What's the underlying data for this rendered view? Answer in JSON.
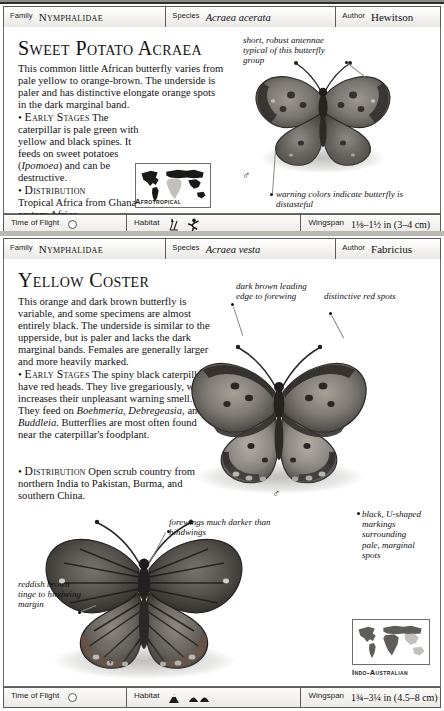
{
  "page": {
    "background": "#ffffff",
    "frame_color": "#b9b7b2"
  },
  "entries": [
    {
      "header": {
        "family_label": "Family",
        "family_value": "Nymphalidae",
        "species_label": "Species",
        "species_value": "Acraea acerata",
        "author_label": "Author",
        "author_value": "Hewitson"
      },
      "title": "Sweet Potato Acraea",
      "description": "This common little African butterfly varies from pale yellow to orange-brown. The underside is paler and has distinctive elongate orange spots in the dark marginal band.",
      "early_stages_label": "Early Stages",
      "early_stages": " The caterpillar is pale green with yellow and black spines. It feeds on sweet potatoes (Ipomoea) and can be destructive.",
      "early_stages_italic": "Ipomoea",
      "distribution_label": "Distribution",
      "distribution": "Tropical Africa from Ghana to eastern Africa.",
      "map_caption": "Afrotropical",
      "map_region": "africa",
      "callouts": [
        {
          "text": "short, robust antennae typical of this butterfly group",
          "name": "callout-antennae"
        },
        {
          "text": "warning colors indicate butterfly is distasteful",
          "name": "callout-warning-colors"
        }
      ],
      "sex_symbol": "♂",
      "footer": {
        "time_of_flight_label": "Time of Flight",
        "time_of_flight_icon": "sun-icon",
        "habitat_label": "Habitat",
        "habitat_icons": [
          "grass-icon",
          "runner-icon"
        ],
        "wingspan_label": "Wingspan",
        "wingspan_value": "1⅛–1½ in (3–4 cm)"
      }
    },
    {
      "header": {
        "family_label": "Family",
        "family_value": "Nymphalidae",
        "species_label": "Species",
        "species_value": "Acraea vesta",
        "author_label": "Author",
        "author_value": "Fabricius"
      },
      "title": "Yellow Coster",
      "description": "This orange and dark brown butterfly is variable, and some specimens are almost entirely black. The underside is similar to the upperside, but is paler and lacks the dark marginal bands. Females are generally larger and more heavily marked.",
      "early_stages_label": "Early Stages",
      "early_stages": " The spiny black caterpillars have red heads. They live gregariously, which increases their unpleasant warning smell. They feed on Boehmeria, Debregeasia, and Buddleia. Butterflies are most often found near the caterpillar's foodplant.",
      "early_stages_plants": [
        "Boehmeria",
        "Debregeasia",
        "Buddleia"
      ],
      "distribution_label": "Distribution",
      "distribution": "Open scrub country from northern India to Pakistan, Burma, and southern China.",
      "map_caption": "Indo-Australian",
      "map_region": "indo-australian",
      "callouts": [
        {
          "text": "dark brown leading edge to forewing",
          "name": "callout-leading-edge"
        },
        {
          "text": "distinctive red spots",
          "name": "callout-red-spots"
        },
        {
          "text": "forewings much darker than hindwings",
          "name": "callout-forewings-darker"
        },
        {
          "text": "black, U-shaped markings surrounding pale, marginal spots",
          "name": "callout-u-shaped-markings"
        },
        {
          "text": "reddish brown tinge to hindwing margin",
          "name": "callout-reddish-tinge"
        }
      ],
      "sex_symbol_upper": "♂",
      "sex_symbol_lower": "♀",
      "footer": {
        "time_of_flight_label": "Time of Flight",
        "time_of_flight_icon": "sun-icon",
        "habitat_label": "Habitat",
        "habitat_icons": [
          "mountain-icon",
          "hills-icon"
        ],
        "wingspan_label": "Wingspan",
        "wingspan_value": "1¾–3¼ in (4.5–8 cm)"
      }
    }
  ]
}
